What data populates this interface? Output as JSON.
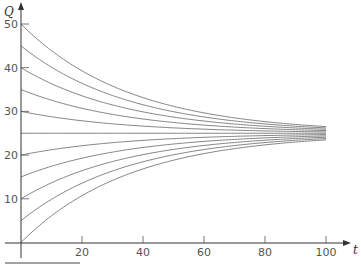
{
  "chart_data": {
    "type": "line",
    "title": "",
    "xlabel": "t",
    "ylabel": "Q",
    "xlim": [
      0,
      100
    ],
    "ylim": [
      0,
      50
    ],
    "x_ticks": [
      20,
      40,
      60,
      80,
      100
    ],
    "y_ticks": [
      10,
      20,
      30,
      40,
      50
    ],
    "grid": false,
    "legend": null,
    "equilibrium": 25,
    "decay_rate": 0.028,
    "x": [
      0,
      10,
      20,
      30,
      40,
      50,
      60,
      70,
      80,
      90,
      100
    ],
    "series": [
      {
        "name": "Q0=50",
        "values": [
          50,
          44.0,
          39.3,
          35.8,
          33.1,
          31.2,
          29.7,
          28.5,
          27.7,
          27.0,
          26.5
        ]
      },
      {
        "name": "Q0=45",
        "values": [
          45,
          40.1,
          36.4,
          33.6,
          31.5,
          29.9,
          28.7,
          27.8,
          27.1,
          26.6,
          26.2
        ]
      },
      {
        "name": "Q0=40",
        "values": [
          40,
          36.3,
          33.5,
          31.5,
          29.9,
          28.7,
          27.8,
          27.1,
          26.6,
          26.2,
          25.9
        ]
      },
      {
        "name": "Q0=35",
        "values": [
          35,
          32.6,
          30.7,
          29.3,
          28.3,
          27.5,
          26.9,
          26.4,
          26.1,
          25.8,
          25.6
        ]
      },
      {
        "name": "Q0=30",
        "values": [
          30,
          28.8,
          27.9,
          27.2,
          26.6,
          26.2,
          25.9,
          25.7,
          25.5,
          25.4,
          25.3
        ]
      },
      {
        "name": "Q0=25",
        "values": [
          25,
          25,
          25,
          25,
          25,
          25,
          25,
          25,
          25,
          25,
          25
        ]
      },
      {
        "name": "Q0=20",
        "values": [
          20,
          21.2,
          22.1,
          22.8,
          23.4,
          23.8,
          24.1,
          24.3,
          24.5,
          24.6,
          24.7
        ]
      },
      {
        "name": "Q0=15",
        "values": [
          15,
          17.4,
          19.3,
          20.7,
          21.7,
          22.5,
          23.1,
          23.6,
          23.9,
          24.2,
          24.4
        ]
      },
      {
        "name": "Q0=10",
        "values": [
          10,
          13.7,
          16.5,
          18.5,
          20.1,
          21.3,
          22.2,
          22.9,
          23.4,
          23.8,
          24.1
        ]
      },
      {
        "name": "Q0=5",
        "values": [
          5,
          9.9,
          13.6,
          16.4,
          18.5,
          20.1,
          21.3,
          22.2,
          22.9,
          23.4,
          23.8
        ]
      },
      {
        "name": "Q0=0",
        "values": [
          0,
          6.0,
          10.7,
          14.2,
          16.9,
          18.8,
          20.3,
          21.5,
          22.3,
          23.0,
          23.5
        ]
      }
    ]
  },
  "axes": {
    "x_label": "t",
    "y_label": "Q",
    "x_tick_labels": [
      "20",
      "40",
      "60",
      "80",
      "100"
    ],
    "y_tick_labels": [
      "10",
      "20",
      "30",
      "40",
      "50"
    ]
  },
  "style": {
    "curve_color": "#777777",
    "axis_color": "#333333"
  }
}
